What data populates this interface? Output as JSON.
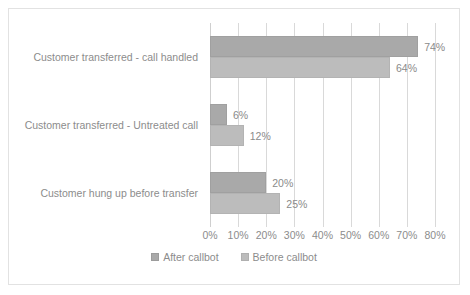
{
  "chart_data": {
    "type": "bar",
    "orientation": "horizontal",
    "title": "",
    "subtitle": "",
    "xlabel": "",
    "ylabel": "",
    "xlim": [
      0,
      80
    ],
    "xtick_labels": [
      "0%",
      "10%",
      "20%",
      "30%",
      "40%",
      "50%",
      "60%",
      "70%",
      "80%"
    ],
    "xtick_values": [
      0,
      10,
      20,
      30,
      40,
      50,
      60,
      70,
      80
    ],
    "grid": true,
    "legend_position": "bottom-center",
    "categories": [
      "Customer transferred - call handled",
      "Customer transferred - Untreated call",
      "Customer hung up before transfer"
    ],
    "series": [
      {
        "name": "After callbot",
        "color": "#a9a9a9",
        "values": [
          74,
          6,
          20
        ],
        "data_labels": [
          "74%",
          "6%",
          "20%"
        ]
      },
      {
        "name": "Before callbot",
        "color": "#bcbcbc",
        "values": [
          64,
          12,
          25
        ],
        "data_labels": [
          "64%",
          "12%",
          "25%"
        ]
      }
    ]
  },
  "legend": {
    "items": [
      {
        "label": "After callbot",
        "series": 0
      },
      {
        "label": "Before callbot",
        "series": 1
      }
    ]
  }
}
